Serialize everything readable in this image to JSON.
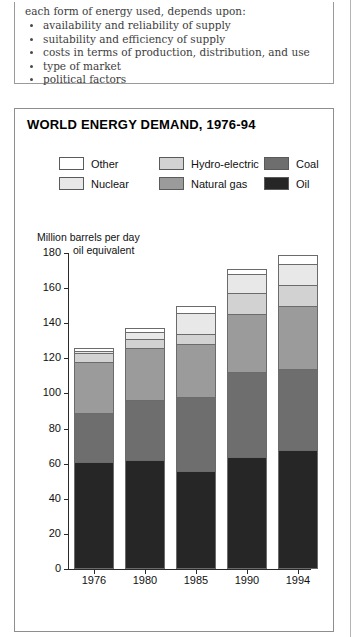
{
  "text_panel": {
    "intro": "each form of energy used, depends upon:",
    "bullets": [
      "availability and reliability of supply",
      "suitability and efficiency of supply",
      "costs in terms of production, distribution, and use",
      "type of market",
      "political factors"
    ]
  },
  "figure": {
    "title": "WORLD ENERGY DEMAND, 1976-94",
    "axis_caption_line1": "Million barrels per day",
    "axis_caption_line2": "oil equivalent"
  },
  "legend": {
    "columns": [
      [
        {
          "label": "Other",
          "color": "#ffffff"
        },
        {
          "label": "Nuclear",
          "color": "#e8e8e8"
        }
      ],
      [
        {
          "label": "Hydro-electric",
          "color": "#d2d2d2"
        },
        {
          "label": "Natural gas",
          "color": "#9b9b9b"
        }
      ],
      [
        {
          "label": "Coal",
          "color": "#6e6e6e"
        },
        {
          "label": "Oil",
          "color": "#262626"
        }
      ]
    ]
  },
  "chart_data": {
    "type": "bar",
    "subtype": "stacked",
    "title": "WORLD ENERGY DEMAND, 1976-94",
    "xlabel": "",
    "ylabel": "Million barrels per day oil equivalent",
    "ylim": [
      0,
      180
    ],
    "ytick_step": 20,
    "yticks": [
      0,
      20,
      40,
      60,
      80,
      100,
      120,
      140,
      160,
      180
    ],
    "grid": false,
    "legend_position": "top",
    "categories": [
      "1976",
      "1980",
      "1985",
      "1990",
      "1994"
    ],
    "series": [
      {
        "name": "Oil",
        "color": "#262626",
        "values": [
          61,
          62,
          56,
          64,
          68
        ]
      },
      {
        "name": "Coal",
        "color": "#6e6e6e",
        "values": [
          28,
          34,
          42,
          48,
          46
        ]
      },
      {
        "name": "Natural gas",
        "color": "#9b9b9b",
        "values": [
          29,
          30,
          30,
          33,
          36
        ]
      },
      {
        "name": "Hydro-electric",
        "color": "#d2d2d2",
        "values": [
          5,
          5,
          6,
          12,
          12
        ]
      },
      {
        "name": "Nuclear",
        "color": "#e8e8e8",
        "values": [
          1,
          4,
          12,
          11,
          12
        ]
      },
      {
        "name": "Other",
        "color": "#ffffff",
        "values": [
          2,
          2,
          4,
          3,
          5
        ]
      }
    ],
    "totals": [
      126,
      137,
      150,
      171,
      179
    ]
  }
}
